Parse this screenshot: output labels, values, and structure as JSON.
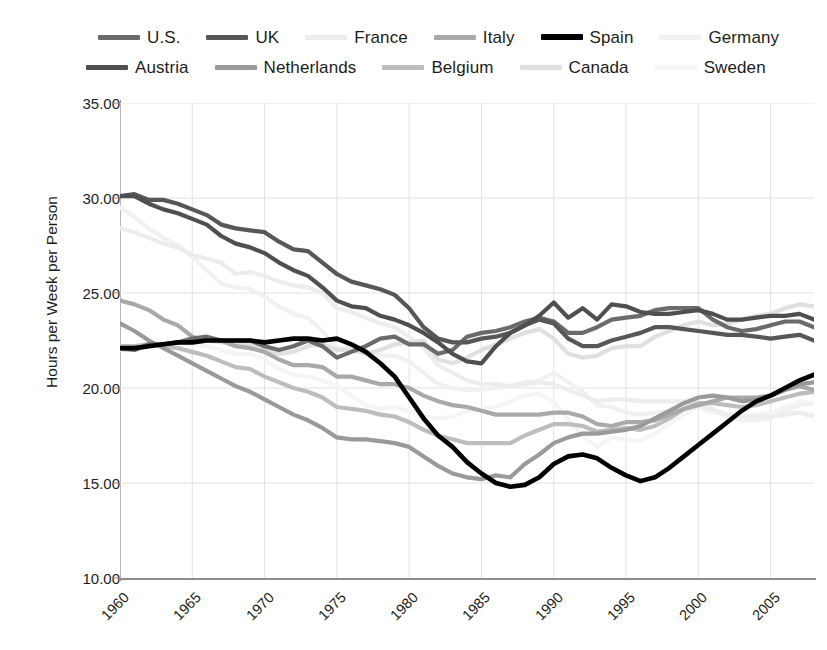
{
  "chart_data": {
    "type": "line",
    "title": "",
    "subtitle": "",
    "xlabel": "",
    "ylabel": "Hours per Week per Person",
    "xlim": [
      1960,
      2008
    ],
    "ylim": [
      10,
      35
    ],
    "grid": true,
    "legend_position": "top",
    "y_ticks": [
      "10.00",
      "15.00",
      "20.00",
      "25.00",
      "30.00",
      "35.00"
    ],
    "y_tick_values": [
      10,
      15,
      20,
      25,
      30,
      35
    ],
    "x_ticks": [
      "1960",
      "1965",
      "1970",
      "1975",
      "1980",
      "1985",
      "1990",
      "1995",
      "2000",
      "2005"
    ],
    "x_tick_values": [
      1960,
      1965,
      1970,
      1975,
      1980,
      1985,
      1990,
      1995,
      2000,
      2005
    ],
    "x": [
      1960,
      1961,
      1962,
      1963,
      1964,
      1965,
      1966,
      1967,
      1968,
      1969,
      1970,
      1971,
      1972,
      1973,
      1974,
      1975,
      1976,
      1977,
      1978,
      1979,
      1980,
      1981,
      1982,
      1983,
      1984,
      1985,
      1986,
      1987,
      1988,
      1989,
      1990,
      1991,
      1992,
      1993,
      1994,
      1995,
      1996,
      1997,
      1998,
      1999,
      2000,
      2001,
      2002,
      2003,
      2004,
      2005,
      2006,
      2007,
      2008
    ],
    "series": [
      {
        "name": "U.S.",
        "color": "#6b6b6b",
        "width": 4.2,
        "values": [
          22.1,
          22.0,
          22.3,
          22.3,
          22.4,
          22.6,
          22.7,
          22.5,
          22.5,
          22.5,
          22.2,
          22.0,
          22.2,
          22.5,
          22.2,
          21.6,
          21.9,
          22.2,
          22.6,
          22.7,
          22.3,
          22.3,
          21.8,
          22.0,
          22.7,
          22.9,
          23.0,
          23.2,
          23.5,
          23.7,
          23.5,
          22.9,
          22.9,
          23.2,
          23.6,
          23.7,
          23.8,
          24.1,
          24.2,
          24.2,
          24.2,
          23.6,
          23.2,
          23.0,
          23.1,
          23.3,
          23.5,
          23.5,
          23.2
        ]
      },
      {
        "name": "UK",
        "color": "#575757",
        "width": 4.2,
        "values": [
          30.1,
          30.2,
          29.9,
          29.9,
          29.7,
          29.4,
          29.1,
          28.6,
          28.4,
          28.3,
          28.2,
          27.7,
          27.3,
          27.2,
          26.6,
          26.0,
          25.6,
          25.4,
          25.2,
          24.9,
          24.2,
          23.2,
          22.6,
          22.4,
          22.4,
          22.6,
          22.7,
          22.9,
          23.3,
          23.6,
          23.4,
          22.6,
          22.2,
          22.2,
          22.5,
          22.7,
          22.9,
          23.2,
          23.2,
          23.1,
          23.0,
          22.9,
          22.8,
          22.8,
          22.7,
          22.6,
          22.7,
          22.8,
          22.5
        ]
      },
      {
        "name": "France",
        "color": "#ededed",
        "width": 4.2,
        "values": [
          28.4,
          28.2,
          27.9,
          27.6,
          27.4,
          27.0,
          26.8,
          26.6,
          26.0,
          26.1,
          25.9,
          25.6,
          25.4,
          25.3,
          25.0,
          24.2,
          24.0,
          23.7,
          23.4,
          23.2,
          22.7,
          22.1,
          21.2,
          20.8,
          20.4,
          20.2,
          20.2,
          20.1,
          20.2,
          20.3,
          20.2,
          19.9,
          19.6,
          19.3,
          19.4,
          19.4,
          19.3,
          19.3,
          19.3,
          19.3,
          19.2,
          18.9,
          18.6,
          18.5,
          18.5,
          18.5,
          18.6,
          18.7,
          18.5
        ]
      },
      {
        "name": "Italy",
        "color": "#a9a9a9",
        "width": 4.2,
        "values": [
          24.6,
          24.4,
          24.1,
          23.6,
          23.3,
          22.7,
          22.5,
          22.5,
          22.2,
          22.1,
          21.9,
          21.5,
          21.2,
          21.2,
          21.1,
          20.6,
          20.6,
          20.4,
          20.2,
          20.2,
          20.0,
          19.6,
          19.3,
          19.1,
          19.0,
          18.8,
          18.6,
          18.6,
          18.6,
          18.6,
          18.7,
          18.7,
          18.5,
          18.1,
          18.0,
          18.2,
          18.2,
          18.3,
          18.6,
          18.9,
          19.1,
          19.3,
          19.5,
          19.5,
          19.5,
          19.6,
          19.9,
          20.1,
          19.9
        ]
      },
      {
        "name": "Spain",
        "color": "#000000",
        "width": 4.6,
        "values": [
          22.1,
          22.1,
          22.2,
          22.3,
          22.4,
          22.4,
          22.5,
          22.5,
          22.5,
          22.5,
          22.4,
          22.5,
          22.6,
          22.6,
          22.5,
          22.6,
          22.3,
          21.9,
          21.3,
          20.6,
          19.5,
          18.4,
          17.5,
          16.9,
          16.1,
          15.5,
          15.0,
          14.8,
          14.9,
          15.3,
          16.0,
          16.4,
          16.5,
          16.3,
          15.8,
          15.4,
          15.1,
          15.3,
          15.8,
          16.4,
          17.0,
          17.6,
          18.2,
          18.8,
          19.3,
          19.6,
          20.0,
          20.4,
          20.7
        ]
      },
      {
        "name": "Germany",
        "color": "#f1f1f1",
        "width": 4.2,
        "values": [
          29.5,
          29.0,
          28.4,
          27.9,
          27.5,
          26.9,
          26.2,
          25.5,
          25.3,
          25.2,
          24.8,
          24.3,
          23.9,
          23.7,
          23.0,
          22.1,
          22.1,
          21.9,
          21.7,
          21.7,
          21.4,
          20.8,
          20.2,
          20.0,
          19.9,
          19.9,
          20.0,
          20.1,
          20.3,
          20.4,
          20.8,
          20.3,
          19.8,
          19.1,
          19.0,
          18.7,
          18.6,
          18.7,
          18.8,
          18.9,
          19.0,
          18.8,
          18.5,
          18.3,
          18.3,
          18.4,
          18.8,
          19.1,
          19.2
        ]
      },
      {
        "name": "Austria",
        "color": "#4f4f4f",
        "width": 4.2,
        "values": [
          30.1,
          30.1,
          29.7,
          29.4,
          29.2,
          28.9,
          28.6,
          28.0,
          27.6,
          27.4,
          27.1,
          26.6,
          26.2,
          25.9,
          25.3,
          24.6,
          24.3,
          24.2,
          23.8,
          23.6,
          23.3,
          22.9,
          22.4,
          21.8,
          21.4,
          21.3,
          22.2,
          22.9,
          23.3,
          23.8,
          24.5,
          23.7,
          24.2,
          23.6,
          24.4,
          24.3,
          24.0,
          23.9,
          23.9,
          24.0,
          24.1,
          23.9,
          23.6,
          23.6,
          23.7,
          23.8,
          23.8,
          23.9,
          23.6
        ]
      },
      {
        "name": "Netherlands",
        "color": "#9a9a9a",
        "width": 4.2,
        "values": [
          23.4,
          23.0,
          22.5,
          22.1,
          21.7,
          21.3,
          20.9,
          20.5,
          20.1,
          19.8,
          19.4,
          19.0,
          18.6,
          18.3,
          17.9,
          17.4,
          17.3,
          17.3,
          17.2,
          17.1,
          16.9,
          16.4,
          15.9,
          15.5,
          15.3,
          15.2,
          15.4,
          15.3,
          16.0,
          16.5,
          17.1,
          17.4,
          17.6,
          17.6,
          17.7,
          17.8,
          18.0,
          18.4,
          18.8,
          19.2,
          19.5,
          19.6,
          19.5,
          19.3,
          19.4,
          19.6,
          19.9,
          20.2,
          20.3
        ]
      },
      {
        "name": "Belgium",
        "color": "#bdbdbd",
        "width": 4.2,
        "values": [
          22.2,
          22.2,
          22.3,
          22.2,
          22.1,
          21.9,
          21.7,
          21.4,
          21.1,
          21.0,
          20.6,
          20.3,
          20.0,
          19.8,
          19.5,
          19.0,
          18.9,
          18.8,
          18.6,
          18.5,
          18.2,
          17.8,
          17.5,
          17.3,
          17.1,
          17.1,
          17.1,
          17.1,
          17.5,
          17.8,
          18.1,
          18.1,
          18.0,
          17.7,
          17.8,
          17.9,
          17.8,
          18.0,
          18.4,
          18.9,
          19.2,
          19.2,
          19.1,
          19.0,
          19.1,
          19.3,
          19.5,
          19.7,
          19.8
        ]
      },
      {
        "name": "Canada",
        "color": "#e0e0e0",
        "width": 4.2,
        "values": [
          22.0,
          22.0,
          22.2,
          22.3,
          22.4,
          22.4,
          22.5,
          22.4,
          22.3,
          22.3,
          22.0,
          21.8,
          21.9,
          22.2,
          22.3,
          22.0,
          22.0,
          21.8,
          22.0,
          22.3,
          22.4,
          22.5,
          21.5,
          21.3,
          21.6,
          22.0,
          22.3,
          22.6,
          22.9,
          23.1,
          22.6,
          21.8,
          21.6,
          21.7,
          22.1,
          22.2,
          22.2,
          22.7,
          23.0,
          23.3,
          23.5,
          23.3,
          23.4,
          23.6,
          23.8,
          23.9,
          24.2,
          24.4,
          24.3
        ]
      },
      {
        "name": "Sweden",
        "color": "#f5f5f5",
        "width": 4.2,
        "values": [
          22.1,
          22.2,
          22.3,
          22.3,
          22.4,
          22.3,
          22.2,
          22.0,
          21.8,
          21.8,
          21.5,
          21.0,
          20.7,
          20.6,
          20.4,
          20.1,
          19.6,
          19.1,
          18.9,
          19.0,
          18.8,
          18.5,
          18.4,
          18.5,
          18.8,
          18.9,
          19.0,
          19.3,
          19.6,
          19.7,
          19.3,
          18.3,
          17.5,
          16.9,
          17.4,
          17.3,
          17.2,
          17.6,
          18.1,
          18.6,
          19.0,
          18.7,
          18.6,
          18.5,
          18.6,
          18.7,
          19.0,
          19.3,
          19.2
        ]
      }
    ]
  },
  "legend": {
    "rows": [
      [
        {
          "label": "U.S.",
          "color": "#6b6b6b"
        },
        {
          "label": "UK",
          "color": "#575757"
        },
        {
          "label": "France",
          "color": "#ededed"
        },
        {
          "label": "Italy",
          "color": "#a9a9a9"
        },
        {
          "label": "Spain",
          "color": "#000000"
        },
        {
          "label": "Germany",
          "color": "#f1f1f1"
        }
      ],
      [
        {
          "label": "Austria",
          "color": "#4f4f4f"
        },
        {
          "label": "Netherlands",
          "color": "#9a9a9a"
        },
        {
          "label": "Belgium",
          "color": "#bdbdbd"
        },
        {
          "label": "Canada",
          "color": "#e0e0e0"
        },
        {
          "label": "Sweden",
          "color": "#f5f5f5"
        }
      ]
    ]
  },
  "axes": {
    "y_axis_title": "Hours per Week per Person"
  }
}
